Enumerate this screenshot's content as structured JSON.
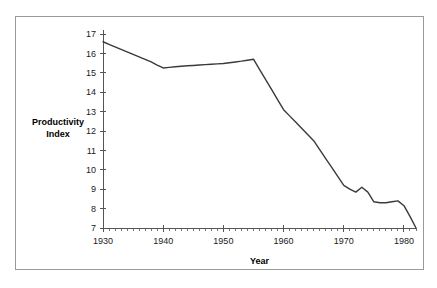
{
  "chart_data": {
    "type": "line",
    "title": "",
    "xlabel": "Year",
    "ylabel": "Productivity Index",
    "ylabel_lines": [
      "Productivity",
      "Index"
    ],
    "xlim": [
      1930,
      1982
    ],
    "ylim": [
      7,
      17
    ],
    "grid": false,
    "legend": null,
    "x_ticks_major": [
      1930,
      1940,
      1950,
      1960,
      1970,
      1980
    ],
    "x_tick_labels": [
      "1930",
      "1940",
      "1950",
      "1960",
      "1970",
      "1980"
    ],
    "x_minor_tick_interval": 1,
    "y_ticks": [
      7,
      8,
      9,
      10,
      11,
      12,
      13,
      14,
      15,
      16,
      17
    ],
    "y_tick_labels": [
      "7",
      "8",
      "9",
      "10",
      "11",
      "12",
      "13",
      "14",
      "15",
      "16",
      "17"
    ],
    "line_color": "#3a3a3a",
    "axis_color": "#555555",
    "background_color": "#ffffff",
    "frame_color": "#9a9a9a",
    "series": [
      {
        "name": "Productivity Index",
        "x": [
          1930,
          1931,
          1932,
          1933,
          1934,
          1935,
          1936,
          1937,
          1938,
          1939,
          1940,
          1941,
          1942,
          1943,
          1944,
          1945,
          1946,
          1947,
          1948,
          1949,
          1950,
          1951,
          1952,
          1953,
          1954,
          1955,
          1956,
          1957,
          1958,
          1959,
          1960,
          1961,
          1962,
          1963,
          1964,
          1965,
          1966,
          1967,
          1968,
          1969,
          1970,
          1971,
          1972,
          1973,
          1974,
          1975,
          1976,
          1977,
          1978,
          1979,
          1980,
          1981,
          1982
        ],
        "values": [
          16.6,
          16.47,
          16.34,
          16.21,
          16.08,
          15.95,
          15.82,
          15.69,
          15.56,
          15.4,
          15.25,
          15.28,
          15.31,
          15.34,
          15.36,
          15.38,
          15.4,
          15.42,
          15.44,
          15.46,
          15.48,
          15.52,
          15.56,
          15.6,
          15.65,
          15.7,
          15.18,
          14.66,
          14.14,
          13.62,
          13.1,
          12.78,
          12.46,
          12.14,
          11.82,
          11.5,
          11.04,
          10.58,
          10.12,
          9.66,
          9.2,
          9.0,
          8.85,
          9.1,
          8.85,
          8.35,
          8.3,
          8.3,
          8.35,
          8.4,
          8.15,
          7.6,
          7.0
        ]
      }
    ]
  }
}
